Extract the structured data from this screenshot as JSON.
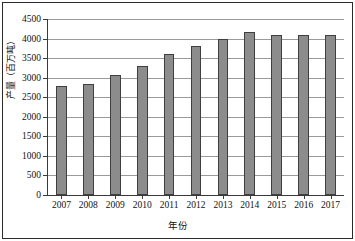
{
  "chart_data": {
    "type": "bar",
    "title": "",
    "xlabel": "年份",
    "ylabel": "产量（百万吨）",
    "categories": [
      "2007",
      "2008",
      "2009",
      "2010",
      "2011",
      "2012",
      "2013",
      "2014",
      "2015",
      "2016",
      "2017"
    ],
    "values": [
      2780,
      2840,
      3060,
      3310,
      3600,
      3800,
      3990,
      4160,
      4090,
      4090,
      4085
    ],
    "ylim": [
      0,
      4500
    ],
    "ytick_labels": [
      "0",
      "500",
      "1000",
      "1500",
      "2000",
      "2500",
      "3000",
      "3500",
      "4000",
      "4500"
    ],
    "ytick_values": [
      0,
      500,
      1000,
      1500,
      2000,
      2500,
      3000,
      3500,
      4000,
      4500
    ],
    "grid": true,
    "legend": "none",
    "bar_color": "#8c8c8c",
    "bar_border_color": "#3f3f3f",
    "grid_color": "#9a9a9a",
    "axis_color": "#3a3a3a"
  }
}
